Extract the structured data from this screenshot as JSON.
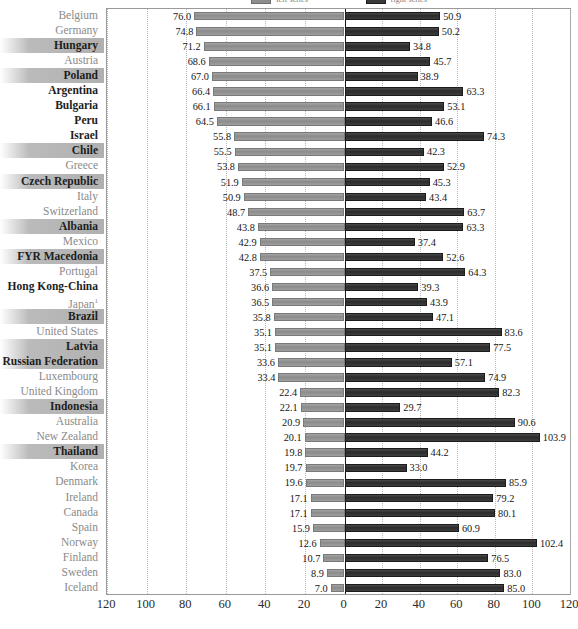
{
  "chart_data": {
    "type": "bar",
    "orientation": "horizontal-diverging",
    "title": "",
    "xlabel": "",
    "ylabel": "",
    "xlim": [
      -120,
      120
    ],
    "xticks": [
      120,
      100,
      80,
      60,
      40,
      20,
      0,
      20,
      40,
      60,
      80,
      100,
      120
    ],
    "grid": true,
    "grid_style": "dotted-vertical",
    "legend_position": "top-center",
    "legend": [
      {
        "name": "left-series",
        "color": "#8d8d8d"
      },
      {
        "name": "right-series",
        "color": "#3a3a3a"
      }
    ],
    "categories": [
      "Belgium",
      "Germany",
      "Hungary",
      "Austria",
      "Poland",
      "Argentina",
      "Bulgaria",
      "Peru",
      "Israel",
      "Chile",
      "Greece",
      "Czech Republic",
      "Italy",
      "Switzerland",
      "Albania",
      "Mexico",
      "FYR Macedonia",
      "Portugal",
      "Hong Kong-China",
      "Japan",
      "Brazil",
      "United States",
      "Latvia",
      "Russian Federation",
      "Luxembourg",
      "United Kingdom",
      "Indonesia",
      "Australia",
      "New Zealand",
      "Thailand",
      "Korea",
      "Denmark",
      "Ireland",
      "Canada",
      "Spain",
      "Norway",
      "Finland",
      "Sweden",
      "Iceland"
    ],
    "series": [
      {
        "name": "left-series",
        "values": [
          76.0,
          74.8,
          71.2,
          68.6,
          67.0,
          66.4,
          66.1,
          64.5,
          55.8,
          55.5,
          53.8,
          51.9,
          50.9,
          48.7,
          43.8,
          42.9,
          42.8,
          37.5,
          36.6,
          36.5,
          35.8,
          35.1,
          35.1,
          33.6,
          33.4,
          22.4,
          22.1,
          20.9,
          20.1,
          19.8,
          19.7,
          19.6,
          17.1,
          17.1,
          15.9,
          12.6,
          10.7,
          8.9,
          7.0
        ]
      },
      {
        "name": "right-series",
        "values": [
          50.9,
          50.2,
          34.8,
          45.7,
          38.9,
          63.3,
          53.1,
          46.6,
          74.3,
          42.3,
          52.9,
          45.3,
          43.4,
          63.7,
          63.3,
          37.4,
          52.6,
          64.3,
          39.3,
          43.9,
          47.1,
          83.6,
          77.5,
          57.1,
          74.9,
          82.3,
          29.7,
          90.6,
          103.9,
          44.2,
          33.0,
          85.9,
          79.2,
          80.1,
          60.9,
          102.4,
          76.5,
          83.0,
          85.0
        ]
      }
    ]
  },
  "rows": [
    {
      "label": "Belgium",
      "left": "76.0",
      "right": "50.9",
      "style": "plain"
    },
    {
      "label": "Germany",
      "left": "74.8",
      "right": "50.2",
      "style": "plain"
    },
    {
      "label": "Hungary",
      "left": "71.2",
      "right": "34.8",
      "style": "highlight"
    },
    {
      "label": "Austria",
      "left": "68.6",
      "right": "45.7",
      "style": "plain"
    },
    {
      "label": "Poland",
      "left": "67.0",
      "right": "38.9",
      "style": "highlight"
    },
    {
      "label": "Argentina",
      "left": "66.4",
      "right": "63.3",
      "style": "bold"
    },
    {
      "label": "Bulgaria",
      "left": "66.1",
      "right": "53.1",
      "style": "bold"
    },
    {
      "label": "Peru",
      "left": "64.5",
      "right": "46.6",
      "style": "bold"
    },
    {
      "label": "Israel",
      "left": "55.8",
      "right": "74.3",
      "style": "bold"
    },
    {
      "label": "Chile",
      "left": "55.5",
      "right": "42.3",
      "style": "highlight"
    },
    {
      "label": "Greece",
      "left": "53.8",
      "right": "52.9",
      "style": "plain"
    },
    {
      "label": "Czech Republic",
      "left": "51.9",
      "right": "45.3",
      "style": "highlight"
    },
    {
      "label": "Italy",
      "left": "50.9",
      "right": "43.4",
      "style": "plain"
    },
    {
      "label": "Switzerland",
      "left": "48.7",
      "right": "63.7",
      "style": "plain"
    },
    {
      "label": "Albania",
      "left": "43.8",
      "right": "63.3",
      "style": "highlight"
    },
    {
      "label": "Mexico",
      "left": "42.9",
      "right": "37.4",
      "style": "plain"
    },
    {
      "label": "FYR Macedonia",
      "left": "42.8",
      "right": "52.6",
      "style": "highlight"
    },
    {
      "label": "Portugal",
      "left": "37.5",
      "right": "64.3",
      "style": "plain"
    },
    {
      "label": "Hong Kong-China",
      "left": "36.6",
      "right": "39.3",
      "style": "bold"
    },
    {
      "label": "Japan",
      "left": "36.5",
      "right": "43.9",
      "style": "plain",
      "sup": "1"
    },
    {
      "label": "Brazil",
      "left": "35.8",
      "right": "47.1",
      "style": "highlight"
    },
    {
      "label": "United States",
      "left": "35.1",
      "right": "83.6",
      "style": "plain"
    },
    {
      "label": "Latvia",
      "left": "35.1",
      "right": "77.5",
      "style": "highlight"
    },
    {
      "label": "Russian Federation",
      "left": "33.6",
      "right": "57.1",
      "style": "highlight"
    },
    {
      "label": "Luxembourg",
      "left": "33.4",
      "right": "74.9",
      "style": "plain"
    },
    {
      "label": "United Kingdom",
      "left": "22.4",
      "right": "82.3",
      "style": "plain"
    },
    {
      "label": "Indonesia",
      "left": "22.1",
      "right": "29.7",
      "style": "highlight"
    },
    {
      "label": "Australia",
      "left": "20.9",
      "right": "90.6",
      "style": "plain"
    },
    {
      "label": "New Zealand",
      "left": "20.1",
      "right": "103.9",
      "style": "plain"
    },
    {
      "label": "Thailand",
      "left": "19.8",
      "right": "44.2",
      "style": "highlight"
    },
    {
      "label": "Korea",
      "left": "19.7",
      "right": "33.0",
      "style": "plain"
    },
    {
      "label": "Denmark",
      "left": "19.6",
      "right": "85.9",
      "style": "plain"
    },
    {
      "label": "Ireland",
      "left": "17.1",
      "right": "79.2",
      "style": "plain"
    },
    {
      "label": "Canada",
      "left": "17.1",
      "right": "80.1",
      "style": "plain"
    },
    {
      "label": "Spain",
      "left": "15.9",
      "right": "60.9",
      "style": "plain"
    },
    {
      "label": "Norway",
      "left": "12.6",
      "right": "102.4",
      "style": "plain"
    },
    {
      "label": "Finland",
      "left": "10.7",
      "right": "76.5",
      "style": "plain"
    },
    {
      "label": "Sweden",
      "left": "8.9",
      "right": "83.0",
      "style": "plain"
    },
    {
      "label": "Iceland",
      "left": "7.0",
      "right": "85.0",
      "style": "plain"
    }
  ],
  "axis": {
    "ticks": [
      "120",
      "100",
      "80",
      "60",
      "40",
      "20",
      "0",
      "20",
      "40",
      "60",
      "80",
      "100",
      "120"
    ]
  },
  "colors": {
    "left_bar": "#8d8d8d",
    "right_bar": "#3a3a3a",
    "grid": "#b9b9b9",
    "zero_line": "#1a1a1a",
    "label_muted": "#8a8a8a",
    "label_strong": "#1d1d1d",
    "highlight_band": "#b0b0b0"
  }
}
